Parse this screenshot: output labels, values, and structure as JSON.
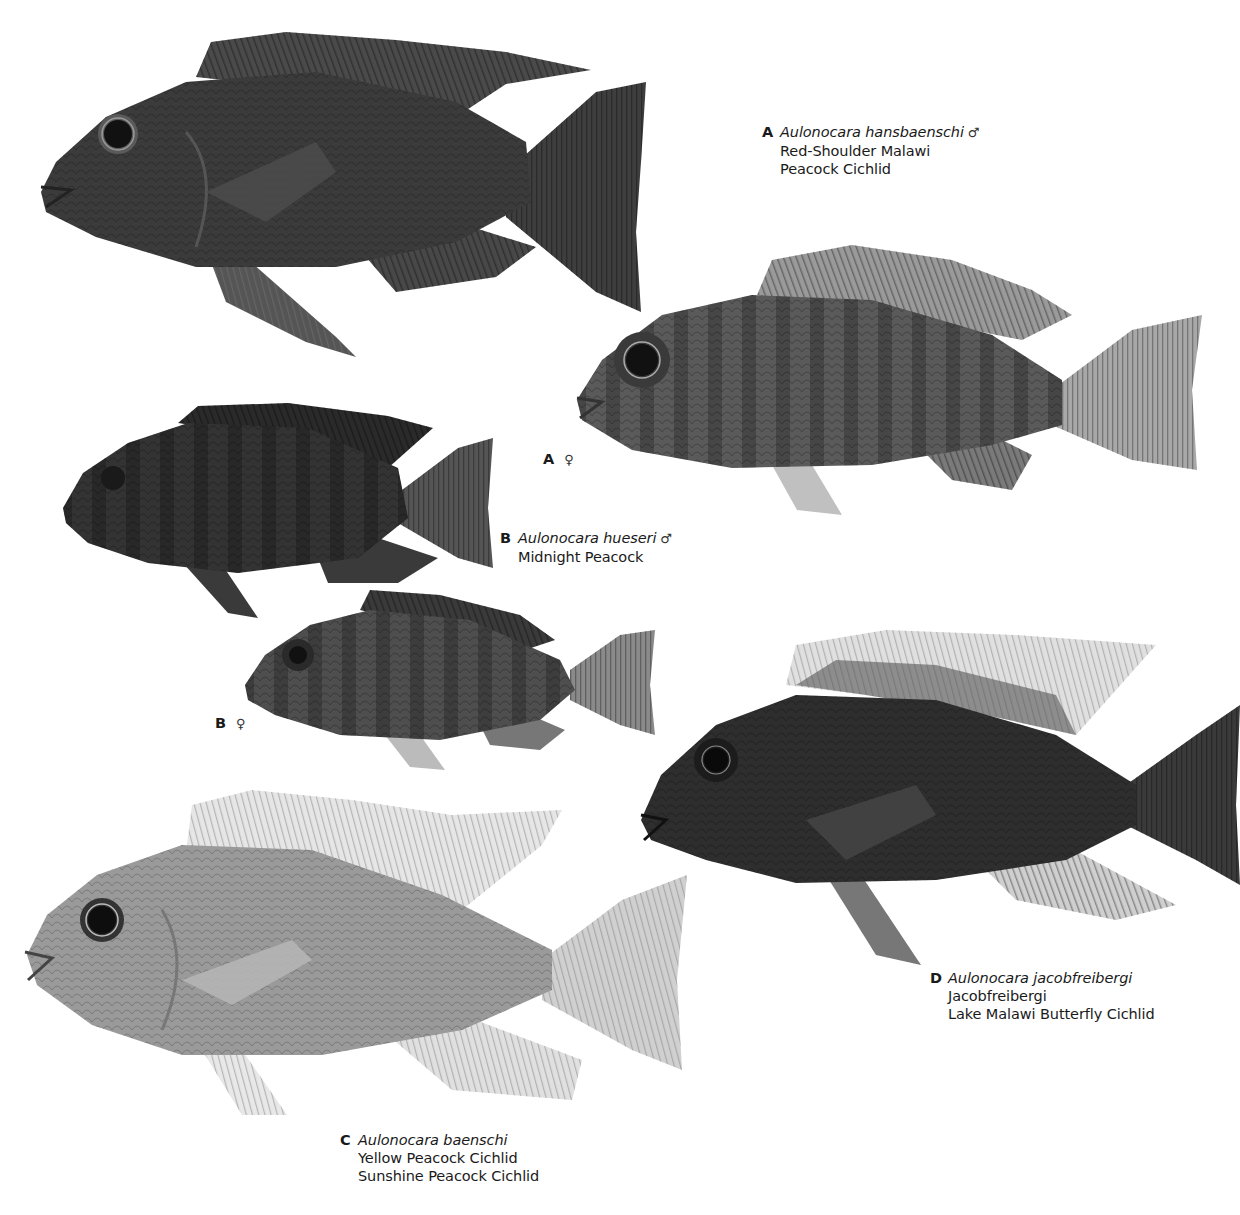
{
  "plate": {
    "background": "#ffffff",
    "specimens": [
      {
        "id": "A-male",
        "letter": "A",
        "scientific_name": "Aulonocara hansbaenschi",
        "sex_symbol": "♂",
        "common_names": [
          "Red-Shoulder Malawi",
          "Peacock Cichlid"
        ],
        "tone": "#3b3b3b"
      },
      {
        "id": "A-female",
        "letter": "A",
        "sex_symbol": "♀",
        "tone": "#5a5a5a"
      },
      {
        "id": "B-male",
        "letter": "B",
        "scientific_name": "Aulonocara hueseri",
        "sex_symbol": "♂",
        "common_names": [
          "Midnight Peacock"
        ],
        "tone": "#333333"
      },
      {
        "id": "B-female",
        "letter": "B",
        "sex_symbol": "♀",
        "tone": "#4e4e4e"
      },
      {
        "id": "C",
        "letter": "C",
        "scientific_name": "Aulonocara baenschi",
        "common_names": [
          "Yellow Peacock Cichlid",
          "Sunshine Peacock Cichlid"
        ],
        "tone": "#9a9a9a"
      },
      {
        "id": "D",
        "letter": "D",
        "scientific_name": "Aulonocara jacobfreibergi",
        "common_names": [
          "Jacobfreibergi",
          "Lake Malawi Butterfly Cichlid"
        ],
        "tone": "#2e2e2e"
      }
    ]
  }
}
